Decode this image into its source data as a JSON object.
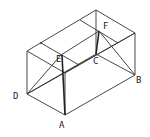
{
  "diagram": {
    "type": "3d-rectangular-box-geometry",
    "labels": {
      "A": "A",
      "B": "B",
      "C": "C",
      "D": "D",
      "E": "E",
      "F": "F"
    },
    "colors": {
      "line": "#333333",
      "background": "#ffffff"
    }
  }
}
